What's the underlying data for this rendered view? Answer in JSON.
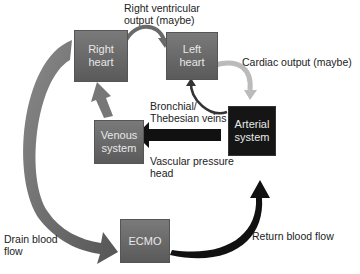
{
  "nodes": {
    "right_heart": "Right\nheart",
    "left_heart": "Left\nheart",
    "arterial_system": "Arterial\nsystem",
    "venous_system": "Venous\nsystem",
    "ecmo": "ECMO"
  },
  "labels": {
    "rv_output": "Right ventricular\noutput (maybe)",
    "cardiac_output": "Cardiac output (maybe)",
    "bronchial": "Bronchial/\nThebesian veins",
    "vascular_pressure": "Vascular pressure\nhead",
    "drain_flow": "Drain blood\nflow",
    "return_flow": "Return blood flow"
  },
  "colors": {
    "gray_box": "#6a6a6a",
    "black_box": "#151515",
    "arrow_gray": "#707070",
    "arrow_black": "#111111"
  }
}
